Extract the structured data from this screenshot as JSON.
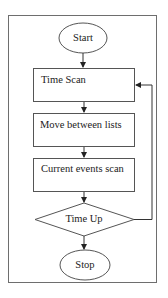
{
  "diagram": {
    "type": "flowchart",
    "nodes": [
      {
        "id": "start",
        "shape": "ellipse",
        "label": "Start"
      },
      {
        "id": "time_scan",
        "shape": "rectangle",
        "label": "Time Scan"
      },
      {
        "id": "move_lists",
        "shape": "rectangle",
        "label": "Move between lists"
      },
      {
        "id": "current_events",
        "shape": "rectangle",
        "label": "Current events scan"
      },
      {
        "id": "time_up",
        "shape": "diamond",
        "label": "Time Up"
      },
      {
        "id": "stop",
        "shape": "ellipse",
        "label": "Stop"
      }
    ],
    "edges": [
      {
        "from": "start",
        "to": "time_scan"
      },
      {
        "from": "time_scan",
        "to": "move_lists"
      },
      {
        "from": "move_lists",
        "to": "current_events"
      },
      {
        "from": "current_events",
        "to": "time_up"
      },
      {
        "from": "time_up",
        "to": "stop"
      },
      {
        "from": "time_up",
        "to": "time_scan",
        "note": "loop back"
      }
    ]
  },
  "colors": {
    "stroke": "#555555",
    "text": "#222222",
    "background": "#ffffff"
  }
}
